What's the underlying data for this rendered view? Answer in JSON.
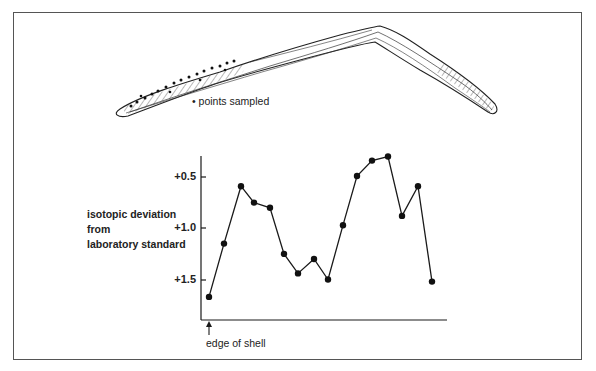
{
  "figure": {
    "legend_text": "• points sampled",
    "annotation_edge": "edge of shell"
  },
  "chart_data": {
    "type": "line",
    "title": "",
    "xlabel": "",
    "ylabel": "isotopic deviation\nfrom\nlaboratory standard",
    "y_inverted": true,
    "yticks": [
      "+0.5",
      "+1.0",
      "+1.5"
    ],
    "ytick_values": [
      0.5,
      1.0,
      1.5
    ],
    "ylim": [
      1.9,
      0.2
    ],
    "grid": false,
    "legend": [
      "points sampled"
    ],
    "annotations": [
      "edge of shell"
    ],
    "x": [
      1,
      2,
      3,
      4,
      5,
      6,
      7,
      8,
      9,
      10,
      11,
      12,
      13,
      14,
      15,
      16
    ],
    "values": [
      1.67,
      1.15,
      0.59,
      0.75,
      0.8,
      1.25,
      1.44,
      1.3,
      1.5,
      0.97,
      0.49,
      0.34,
      0.3,
      0.88,
      0.59,
      1.52
    ]
  },
  "colors": {
    "ink": "#1a1a1a",
    "frame": "#555555",
    "background": "#ffffff"
  }
}
